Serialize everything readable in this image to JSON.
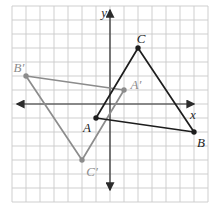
{
  "figure": {
    "type": "coordinate-plane-triangles",
    "axis_labels": {
      "x": "x",
      "y": "y"
    },
    "grid": {
      "x_range": [
        -7,
        7
      ],
      "y_range": [
        -7,
        7
      ],
      "spacing_units": 1
    },
    "colors": {
      "grid": "#c9c9c9",
      "axes": "#2b2b2b",
      "preimage_triangle": "#1d1d1d",
      "image_triangle": "#8c8c8c"
    },
    "triangles": [
      {
        "name": "triangle-A-prime-B-prime-C-prime",
        "color_key": "image_triangle",
        "vertices": [
          {
            "label": "A′",
            "id": "A-prime",
            "x": 1,
            "y": 1,
            "label_offset": [
              12,
              -1
            ]
          },
          {
            "label": "B′",
            "id": "B-prime",
            "x": -6,
            "y": 2,
            "label_offset": [
              -7,
              -4
            ]
          },
          {
            "label": "C′",
            "id": "C-prime",
            "x": -2,
            "y": -4,
            "label_offset": [
              10,
              16
            ]
          }
        ]
      },
      {
        "name": "triangle-A-B-C",
        "color_key": "preimage_triangle",
        "vertices": [
          {
            "label": "A",
            "id": "A",
            "x": -1,
            "y": -1,
            "label_offset": [
              -9,
              14
            ]
          },
          {
            "label": "B",
            "id": "B",
            "x": 6,
            "y": -2,
            "label_offset": [
              7,
              15
            ]
          },
          {
            "label": "C",
            "id": "C",
            "x": 2,
            "y": 4,
            "label_offset": [
              3,
              -5
            ]
          }
        ]
      }
    ]
  }
}
